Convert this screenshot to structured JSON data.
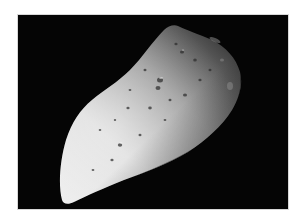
{
  "image": {
    "subject": "asteroid",
    "alt": "Grayscale photograph of an elongated, cratered asteroid against a black space background",
    "background_color": "#050505",
    "border_color": "#ffffff"
  }
}
